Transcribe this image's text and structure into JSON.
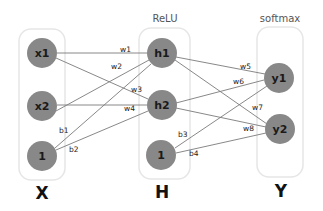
{
  "diagram": {
    "layers": [
      {
        "id": "X",
        "label": "X",
        "activation": "",
        "nodes": [
          "x1",
          "x2",
          "1"
        ]
      },
      {
        "id": "H",
        "label": "H",
        "activation": "ReLU",
        "nodes": [
          "h1",
          "h2",
          "1"
        ]
      },
      {
        "id": "Y",
        "label": "Y",
        "activation": "softmax",
        "nodes": [
          "y1",
          "y2"
        ]
      }
    ],
    "edges": [
      {
        "from": "x1",
        "to": "h1",
        "label": "w1"
      },
      {
        "from": "x2",
        "to": "h1",
        "label": "w2"
      },
      {
        "from": "x1",
        "to": "h2",
        "label": "w3"
      },
      {
        "from": "x2",
        "to": "h2",
        "label": "w4"
      },
      {
        "from": "bias_x",
        "to": "h1",
        "label": "b1"
      },
      {
        "from": "bias_x",
        "to": "h2",
        "label": "b2"
      },
      {
        "from": "h1",
        "to": "y1",
        "label": "w5"
      },
      {
        "from": "h2",
        "to": "y1",
        "label": "w6"
      },
      {
        "from": "h1",
        "to": "y2",
        "label": "w7"
      },
      {
        "from": "h2",
        "to": "y2",
        "label": "w8"
      },
      {
        "from": "bias_h",
        "to": "y1",
        "label": "b3"
      },
      {
        "from": "bias_h",
        "to": "y2",
        "label": "b4"
      }
    ],
    "colors": {
      "node": "#888888",
      "edge": "#7a7a7a",
      "box_border": "#e6e6e6"
    }
  }
}
